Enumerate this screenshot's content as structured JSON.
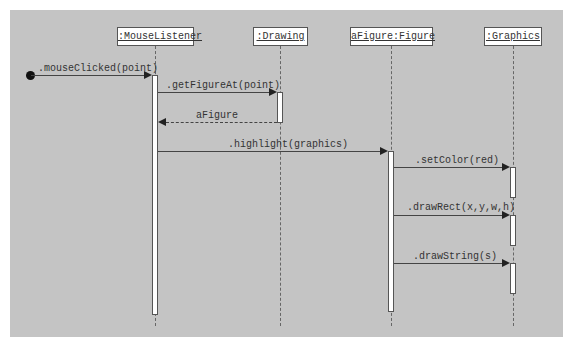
{
  "diagram": {
    "type": "uml-sequence",
    "objects": [
      {
        "id": "mouselistener",
        "label": ":MouseListener"
      },
      {
        "id": "drawing",
        "label": ":Drawing"
      },
      {
        "id": "afigure",
        "label": "aFigure:Figure"
      },
      {
        "id": "graphics",
        "label": ":Graphics"
      }
    ],
    "messages": [
      {
        "from": "start",
        "to": "mouselistener",
        "label": ".mouseClicked(point)",
        "kind": "call"
      },
      {
        "from": "mouselistener",
        "to": "drawing",
        "label": ".getFigureAt(point)",
        "kind": "call"
      },
      {
        "from": "drawing",
        "to": "mouselistener",
        "label": "aFigure",
        "kind": "return"
      },
      {
        "from": "mouselistener",
        "to": "afigure",
        "label": ".highlight(graphics)",
        "kind": "call"
      },
      {
        "from": "afigure",
        "to": "graphics",
        "label": ".setColor(red)",
        "kind": "call"
      },
      {
        "from": "afigure",
        "to": "graphics",
        "label": ".drawRect(x,y,w,h)",
        "kind": "call"
      },
      {
        "from": "afigure",
        "to": "graphics",
        "label": ".drawString(s)",
        "kind": "call"
      }
    ],
    "colors": {
      "background": "#c4c4c4",
      "box_fill": "#ffffff",
      "line": "#444444"
    }
  }
}
